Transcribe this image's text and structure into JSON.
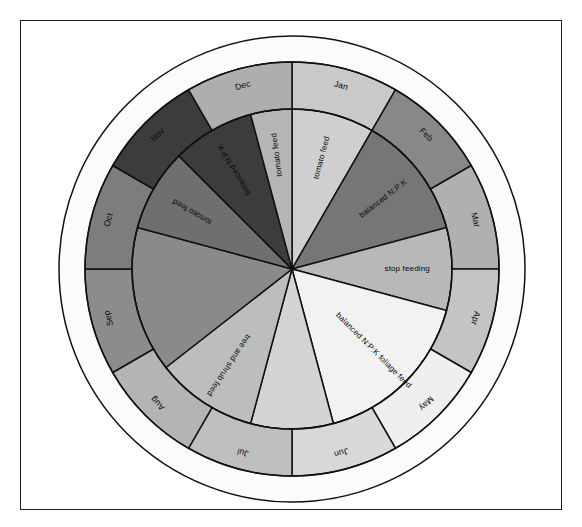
{
  "figure": {
    "type": "feeding-calendar-wheel",
    "title": "",
    "border_color": "#1d1d1d",
    "background_color": "#ffffff",
    "outer_ring_color": "#fbfbfb",
    "center": [
      292,
      269
    ],
    "radii": {
      "outer_ring": 233,
      "wheel": 207,
      "month_inner": 160,
      "hub": 0
    }
  },
  "chart_data": {
    "type": "pie",
    "title": "",
    "categories": [
      "Jan",
      "Feb",
      "Mar",
      "Apr",
      "May",
      "Jun",
      "Jul",
      "Aug",
      "Sep",
      "Oct",
      "Nov",
      "Dec"
    ],
    "values": [
      30,
      30,
      30,
      30,
      30,
      30,
      30,
      30,
      30,
      30,
      30,
      30
    ],
    "legend": "none",
    "months": [
      {
        "label": "Jan",
        "start_deg": 0,
        "end_deg": 30,
        "color": "#c9c9c9"
      },
      {
        "label": "Feb",
        "start_deg": 30,
        "end_deg": 60,
        "color": "#888888"
      },
      {
        "label": "Mar",
        "start_deg": 60,
        "end_deg": 90,
        "color": "#b0b0b0"
      },
      {
        "label": "Apr",
        "start_deg": 90,
        "end_deg": 120,
        "color": "#c4c4c4"
      },
      {
        "label": "May",
        "start_deg": 120,
        "end_deg": 150,
        "color": "#efefef"
      },
      {
        "label": "Jun",
        "start_deg": 150,
        "end_deg": 180,
        "color": "#d8d8d8"
      },
      {
        "label": "Jul",
        "start_deg": 180,
        "end_deg": 210,
        "color": "#bfbfbf"
      },
      {
        "label": "Aug",
        "start_deg": 210,
        "end_deg": 240,
        "color": "#b4b4b4"
      },
      {
        "label": "Sep",
        "start_deg": 240,
        "end_deg": 270,
        "color": "#8c8c8c"
      },
      {
        "label": "Oct",
        "start_deg": 270,
        "end_deg": 300,
        "color": "#7d7d7d"
      },
      {
        "label": "Nov",
        "start_deg": 300,
        "end_deg": 330,
        "color": "#3c3c3c"
      },
      {
        "label": "Dec",
        "start_deg": 330,
        "end_deg": 360,
        "color": "#aeaeae"
      }
    ],
    "advice_segments": [
      {
        "label": "tomato feed",
        "start_deg": 0,
        "end_deg": 30,
        "color": "#cfcfcf"
      },
      {
        "label": "balanced N:P:K",
        "start_deg": 30,
        "end_deg": 75,
        "color": "#767676"
      },
      {
        "label": "stop feeding",
        "start_deg": 75,
        "end_deg": 105,
        "color": "#b8b8b8"
      },
      {
        "label": "balanced N:P:K foliage feed",
        "start_deg": 105,
        "end_deg": 165,
        "color": "#f2f2f2"
      },
      {
        "label": "",
        "start_deg": 165,
        "end_deg": 195,
        "color": "#d4d4d4"
      },
      {
        "label": "tree and shrub feed",
        "start_deg": 195,
        "end_deg": 232,
        "color": "#bdbdbd"
      },
      {
        "label": "",
        "start_deg": 232,
        "end_deg": 285,
        "color": "#8a8a8a"
      },
      {
        "label": "tomato feed",
        "start_deg": 285,
        "end_deg": 315,
        "color": "#6f6f6f"
      },
      {
        "label": "balanced N:P:K",
        "start_deg": 315,
        "end_deg": 345,
        "color": "#3c3c3c"
      },
      {
        "label": "tomato feed",
        "start_deg": 345,
        "end_deg": 360,
        "color": "#b6b6b6"
      }
    ],
    "month_labels": [
      "Jan",
      "Feb",
      "Mar",
      "Apr",
      "May",
      "Jun",
      "Jul",
      "Aug",
      "Sep",
      "Oct",
      "Nov",
      "Dec"
    ],
    "advice_labels": [
      "tomato feed",
      "balanced N:P:K",
      "stop feeding",
      "balanced N:P:K foliage feed",
      "tree and shrub feed",
      "tomato feed",
      "balanced N:P:K",
      "tomato feed"
    ]
  }
}
